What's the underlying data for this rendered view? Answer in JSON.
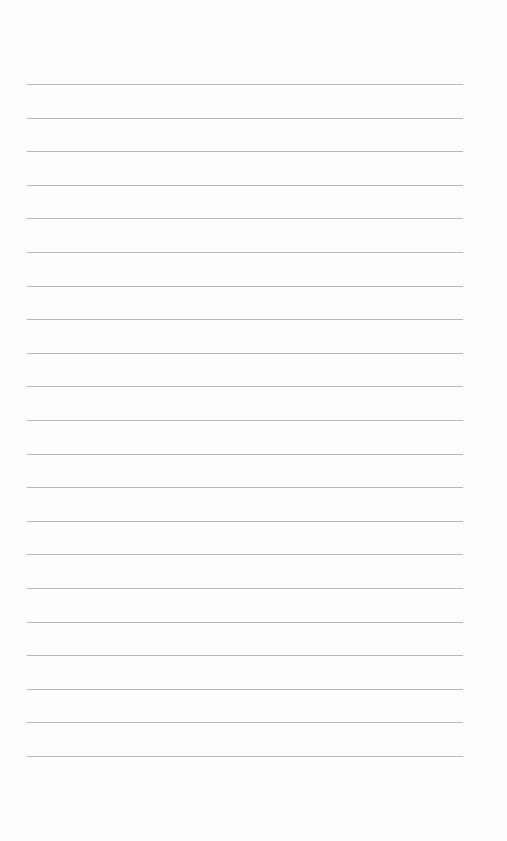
{
  "page": {
    "type": "lined-paper",
    "background_color": "#fefefe",
    "line_color": "#b8b8b8",
    "line_count": 21,
    "first_line_y": 84,
    "line_spacing": 33.6,
    "line_left": 27,
    "line_width": 436
  }
}
